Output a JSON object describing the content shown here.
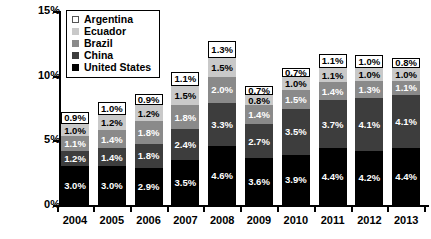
{
  "chart_data": {
    "type": "bar",
    "subtype": "stacked-bar",
    "title": "",
    "xlabel": "",
    "ylabel": "Percent of Peru's GDP",
    "ylim": [
      0,
      15
    ],
    "ytick_values": [
      0,
      5,
      10,
      15
    ],
    "ytick_labels": [
      "0%",
      "5%",
      "10%",
      "15%"
    ],
    "grid": false,
    "legend_position": "top-left",
    "value_suffix": "%",
    "categories": [
      "2004",
      "2005",
      "2006",
      "2007",
      "2008",
      "2009",
      "2010",
      "2011",
      "2012",
      "2013"
    ],
    "series": [
      {
        "name": "United States",
        "color": "#000000",
        "label_color": "#ffffff",
        "values": [
          3.0,
          3.0,
          2.9,
          3.5,
          4.6,
          3.6,
          3.9,
          4.4,
          4.2,
          4.4
        ],
        "labels": [
          "3.0%",
          "3.0%",
          "2.9%",
          "3.5%",
          "4.6%",
          "3.6%",
          "3.9%",
          "4.4%",
          "4.2%",
          "4.4%"
        ]
      },
      {
        "name": "China",
        "color": "#3d3d3d",
        "label_color": "#ffffff",
        "values": [
          1.2,
          1.4,
          1.8,
          2.4,
          3.3,
          2.7,
          3.5,
          3.7,
          4.1,
          4.1
        ],
        "labels": [
          "1.2%",
          "1.4%",
          "1.8%",
          "2.4%",
          "3.3%",
          "2.7%",
          "3.5%",
          "3.7%",
          "4.1%",
          "4.1%"
        ]
      },
      {
        "name": "Brazil",
        "color": "#8a8a8a",
        "label_color": "#ffffff",
        "values": [
          1.1,
          1.4,
          1.8,
          1.8,
          2.0,
          1.4,
          1.5,
          1.4,
          1.3,
          1.1
        ],
        "labels": [
          "1.1%",
          "1.4%",
          "1.8%",
          "1.8%",
          "2.0%",
          "1.4%",
          "1.5%",
          "1.4%",
          "1.3%",
          "1.1%"
        ]
      },
      {
        "name": "Ecuador",
        "color": "#c9c9c9",
        "label_color": "#000000",
        "values": [
          1.0,
          1.2,
          1.2,
          1.5,
          1.5,
          0.8,
          1.0,
          1.1,
          1.0,
          1.0
        ],
        "labels": [
          "1.0%",
          "1.2%",
          "1.2%",
          "1.5%",
          "1.5%",
          "0.8%",
          "1.0%",
          "1.1%",
          "1.0%",
          "1.0%"
        ]
      },
      {
        "name": "Argentina",
        "color": "#ffffff",
        "label_color": "#000000",
        "values": [
          0.9,
          1.0,
          0.9,
          1.1,
          1.3,
          0.7,
          0.7,
          1.1,
          1.0,
          0.8
        ],
        "labels": [
          "0.9%",
          "1.0%",
          "0.9%",
          "1.1%",
          "1.3%",
          "0.7%",
          "0.7%",
          "1.1%",
          "1.0%",
          "0.8%"
        ]
      }
    ],
    "totals": [
      7.2,
      8.0,
      8.6,
      10.3,
      12.7,
      9.2,
      10.6,
      11.7,
      11.6,
      11.4
    ]
  },
  "legend": {
    "items": [
      {
        "label": "Argentina",
        "swatch": "sw-argentina"
      },
      {
        "label": "Ecuador",
        "swatch": "sw-ecuador"
      },
      {
        "label": "Brazil",
        "swatch": "sw-brazil"
      },
      {
        "label": "China",
        "swatch": "sw-china"
      },
      {
        "label": "United States",
        "swatch": "sw-unitedstates"
      }
    ]
  }
}
